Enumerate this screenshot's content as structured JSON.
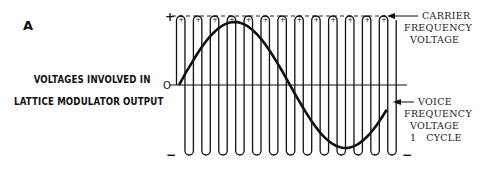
{
  "figure": {
    "panel_label": "A",
    "title_line1": "VOLTAGES INVOLVED IN",
    "title_line2": "LATTICE MODULATOR OUTPUT"
  },
  "axis": {
    "plus": "+",
    "zero": "O",
    "minus": "−",
    "minus_right": "−"
  },
  "annotations": {
    "carrier": [
      "CARRIER",
      "FREQUENCY",
      "VOLTAGE"
    ],
    "voice": [
      "VOICE",
      "FREQUENCY",
      "VOLTAGE",
      "1   CYCLE"
    ]
  },
  "carrier_peak_symbol": "+",
  "colors": {
    "ink": "#111111",
    "background": "#ffffff"
  }
}
